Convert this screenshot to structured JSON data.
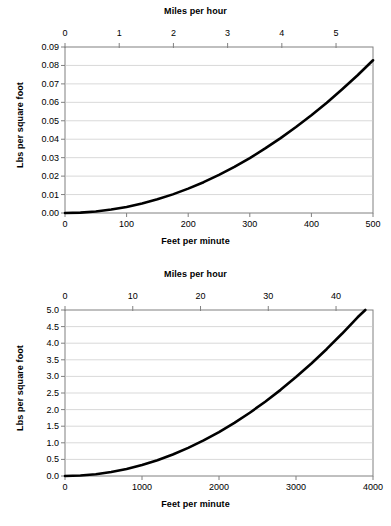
{
  "figure": {
    "panels": [
      "top",
      "bottom"
    ]
  },
  "chart_data": [
    {
      "id": "top",
      "type": "line",
      "title": "",
      "xlabel": "Feet per minute",
      "ylabel": "Lbs per square foot",
      "x2label": "Miles per hour",
      "xlim": [
        0,
        500
      ],
      "ylim": [
        0.0,
        0.09
      ],
      "x2lim": [
        0,
        5.6818
      ],
      "grid": true,
      "legend": "none",
      "xticks": [
        0,
        100,
        200,
        300,
        400,
        500
      ],
      "xticklabels": [
        "0",
        "100",
        "200",
        "300",
        "400",
        "500"
      ],
      "yticks": [
        0.0,
        0.01,
        0.02,
        0.03,
        0.04,
        0.05,
        0.06,
        0.07,
        0.08,
        0.09
      ],
      "yticklabels": [
        "0.00",
        "0.01",
        "0.02",
        "0.03",
        "0.04",
        "0.05",
        "0.06",
        "0.07",
        "0.08",
        "0.09"
      ],
      "x2ticks": [
        0,
        1,
        2,
        3,
        4,
        5
      ],
      "x2ticklabels": [
        "0",
        "1",
        "2",
        "3",
        "4",
        "5"
      ],
      "series": [
        {
          "name": "Wind pressure",
          "x": [
            0,
            25,
            50,
            75,
            100,
            125,
            150,
            175,
            200,
            225,
            250,
            275,
            300,
            325,
            350,
            375,
            400,
            425,
            450,
            475,
            500
          ],
          "y": [
            0.0,
            0.0002,
            0.0008,
            0.0019,
            0.0033,
            0.0052,
            0.0074,
            0.0101,
            0.0132,
            0.0167,
            0.0207,
            0.025,
            0.0298,
            0.035,
            0.0406,
            0.0466,
            0.053,
            0.0598,
            0.0671,
            0.0747,
            0.0828
          ]
        }
      ]
    },
    {
      "id": "bottom",
      "type": "line",
      "title": "",
      "xlabel": "Feet per minute",
      "ylabel": "Lbs per square foot",
      "x2label": "Miles per hour",
      "xlim": [
        0,
        4000
      ],
      "ylim": [
        0.0,
        5.0
      ],
      "x2lim": [
        0,
        45.4545
      ],
      "grid": true,
      "legend": "none",
      "xticks": [
        0,
        1000,
        2000,
        3000,
        4000
      ],
      "xticklabels": [
        "0",
        "1000",
        "2000",
        "3000",
        "4000"
      ],
      "yticks": [
        0.0,
        0.5,
        1.0,
        1.5,
        2.0,
        2.5,
        3.0,
        3.5,
        4.0,
        4.5,
        5.0
      ],
      "yticklabels": [
        "0.0",
        "0.5",
        "1.0",
        "1.5",
        "2.0",
        "2.5",
        "3.0",
        "3.5",
        "4.0",
        "4.5",
        "5.0"
      ],
      "x2ticks": [
        0,
        10,
        20,
        30,
        40
      ],
      "x2ticklabels": [
        "0",
        "10",
        "20",
        "30",
        "40"
      ],
      "series": [
        {
          "name": "Wind pressure",
          "x": [
            0,
            200,
            400,
            600,
            800,
            1000,
            1200,
            1400,
            1600,
            1800,
            2000,
            2200,
            2400,
            2600,
            2800,
            3000,
            3200,
            3400,
            3600,
            3800,
            3900
          ],
          "y": [
            0.0,
            0.013,
            0.053,
            0.119,
            0.212,
            0.331,
            0.476,
            0.648,
            0.847,
            1.072,
            1.324,
            1.602,
            1.906,
            2.238,
            2.595,
            2.98,
            3.39,
            3.827,
            4.291,
            4.781,
            5.0
          ]
        }
      ]
    }
  ],
  "colors": {
    "curve": "#000000",
    "grid": "#c8c8c8",
    "frame": "#808080",
    "background": "#ffffff",
    "text": "#000000"
  }
}
